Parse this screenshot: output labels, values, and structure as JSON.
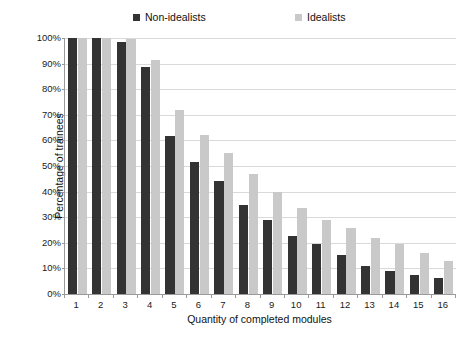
{
  "chart_data": {
    "type": "bar",
    "title": "",
    "xlabel": "Quantity of completed modules",
    "ylabel": "Percentage of trainees",
    "categories": [
      "1",
      "2",
      "3",
      "4",
      "5",
      "6",
      "7",
      "8",
      "9",
      "10",
      "11",
      "12",
      "13",
      "14",
      "15",
      "16"
    ],
    "series": [
      {
        "name": "Non-idealists",
        "color": "#333333",
        "values": [
          100,
          100,
          98.5,
          88.5,
          61.8,
          51.6,
          44.0,
          34.8,
          28.8,
          22.5,
          19.4,
          15.3,
          10.9,
          9.1,
          7.6,
          6.1
        ]
      },
      {
        "name": "Idealists",
        "color": "#c9c9c9",
        "values": [
          100,
          100,
          99.5,
          91.5,
          72.0,
          62.0,
          55.0,
          47.0,
          40.0,
          33.7,
          29.0,
          25.7,
          21.8,
          19.6,
          15.9,
          13.0
        ]
      }
    ],
    "ylim": [
      0,
      100
    ],
    "yticks": [
      "0%",
      "10%",
      "20%",
      "30%",
      "40%",
      "50%",
      "60%",
      "70%",
      "80%",
      "90%",
      "100%"
    ],
    "ytick_values": [
      0,
      10,
      20,
      30,
      40,
      50,
      60,
      70,
      80,
      90,
      100
    ],
    "grid": true,
    "legend_position": "top"
  },
  "legend": {
    "entries": [
      {
        "label": "Non-idealists",
        "color": "#333333"
      },
      {
        "label": "Idealists",
        "color": "#c9c9c9"
      }
    ]
  }
}
